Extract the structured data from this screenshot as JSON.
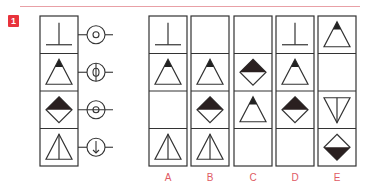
{
  "question": {
    "number": "1",
    "accent_color": "#e8333c",
    "stem": {
      "rows": [
        {
          "shape": "inverted-t",
          "connector": "circle-with-dot"
        },
        {
          "shape": "triangle-black-tip",
          "connector": "circle-with-phi"
        },
        {
          "shape": "diamond-black-top",
          "connector": "circle-with-dot-line"
        },
        {
          "shape": "triangle-with-vertical-line",
          "connector": "circle-with-down-arrow"
        }
      ]
    },
    "options": [
      {
        "label": "A",
        "cells": [
          "inverted-t",
          "triangle-black-tip",
          "empty",
          "triangle-with-vertical-line"
        ]
      },
      {
        "label": "B",
        "cells": [
          "empty",
          "triangle-black-tip",
          "diamond-black-top",
          "triangle-with-vertical-line"
        ]
      },
      {
        "label": "C",
        "cells": [
          "empty",
          "diamond-black-top",
          "triangle-black-tip",
          "empty"
        ]
      },
      {
        "label": "D",
        "cells": [
          "inverted-t",
          "triangle-black-tip",
          "diamond-black-top",
          "empty"
        ]
      },
      {
        "label": "E",
        "cells": [
          "triangle-black-tip",
          "empty",
          "inverted-triangle-with-vertical-line",
          "diamond-black-bottom"
        ]
      }
    ]
  }
}
